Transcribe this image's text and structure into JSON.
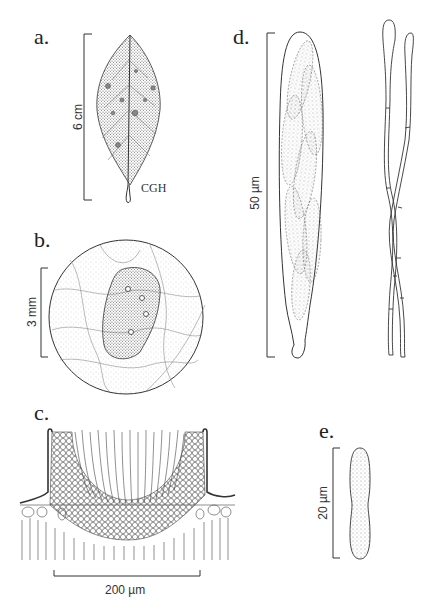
{
  "figure": {
    "panels": [
      {
        "id": "a",
        "label": "a.",
        "subject": "leaf",
        "scale_bar": "6 cm",
        "signature": "CGH"
      },
      {
        "id": "b",
        "label": "b.",
        "subject": "lesion on leaf (magnified circle)",
        "scale_bar": "3 mm"
      },
      {
        "id": "c",
        "label": "c.",
        "subject": "apothecium cross-section",
        "scale_bar": "200 µm"
      },
      {
        "id": "d",
        "label": "d.",
        "subject": "ascus with ascospores and paraphyses",
        "scale_bar": "50 µm"
      },
      {
        "id": "e",
        "label": "e.",
        "subject": "ascospore",
        "scale_bar": "20 µm"
      }
    ],
    "signature": "CGH"
  },
  "labels": {
    "a": "a.",
    "b": "b.",
    "c": "c.",
    "d": "d.",
    "e": "e."
  },
  "scales": {
    "a": "6 cm",
    "b": "3 mm",
    "c": "200 µm",
    "d": "50 µm",
    "e": "20 µm"
  },
  "colors": {
    "ink": "#222222",
    "stipple": "#888888",
    "background": "#ffffff"
  }
}
